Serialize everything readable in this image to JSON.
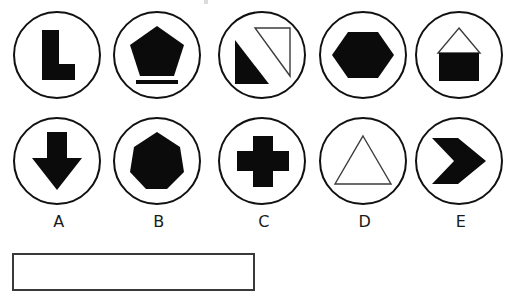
{
  "sheet": {
    "title": "multiple-choice shape options sheet",
    "background_color": "#ffffff",
    "stroke_color": "#111111",
    "fill_color": "#0b0b0b",
    "outline_color": "#3c3c3c"
  },
  "rows": [
    {
      "row_index": 0,
      "labelled": false,
      "options": [
        {
          "id": "r1c1",
          "shape": "l-shape",
          "fill": "solid",
          "extra": "none",
          "label": ""
        },
        {
          "id": "r1c2",
          "shape": "pentagon",
          "fill": "solid",
          "extra": "underline-bar",
          "label": ""
        },
        {
          "id": "r1c3",
          "shape": "double-right-triangle",
          "fill": "mixed",
          "extra": "one-solid-one-outline",
          "label": ""
        },
        {
          "id": "r1c4",
          "shape": "hexagon",
          "fill": "solid",
          "extra": "none",
          "label": ""
        },
        {
          "id": "r1c5",
          "shape": "house",
          "fill": "mixed",
          "extra": "outline-roof-solid-base",
          "label": ""
        }
      ]
    },
    {
      "row_index": 1,
      "labelled": true,
      "options": [
        {
          "id": "r2c1",
          "shape": "down-arrow",
          "fill": "solid",
          "extra": "none",
          "label": "A"
        },
        {
          "id": "r2c2",
          "shape": "heptagon",
          "fill": "solid",
          "extra": "none",
          "label": "B"
        },
        {
          "id": "r2c3",
          "shape": "cross",
          "fill": "solid",
          "extra": "none",
          "label": "C"
        },
        {
          "id": "r2c4",
          "shape": "triangle",
          "fill": "outline",
          "extra": "none",
          "label": "D"
        },
        {
          "id": "r2c5",
          "shape": "chevron-right",
          "fill": "solid",
          "extra": "none",
          "label": "E"
        }
      ]
    }
  ],
  "answer_box": {
    "name": "answer-entry-box",
    "value": "",
    "placeholder": ""
  }
}
